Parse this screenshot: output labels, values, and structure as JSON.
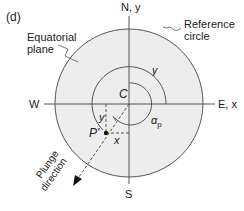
{
  "panel_label": "(d)",
  "labels": {
    "equatorial_plane_line1": "Equatorial",
    "equatorial_plane_line2": "plane",
    "reference_circle_line1": "Reference",
    "reference_circle_line2": "circle",
    "north": "N, y",
    "south": "S",
    "west": "W",
    "east": "E, x",
    "center": "C",
    "gamma": "γ",
    "alpha_p": "α",
    "alpha_p_sub": "p",
    "point": "P'",
    "x_offset": "x",
    "y_offset": "y",
    "plunge_line1": "Plunge",
    "plunge_line2": "direction"
  },
  "colors": {
    "circle_fill": "#ededed",
    "stroke": "#555555",
    "text": "#222222"
  }
}
